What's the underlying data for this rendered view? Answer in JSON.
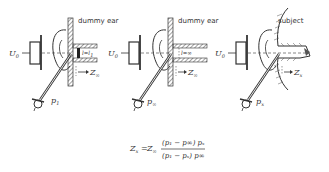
{
  "panels": [
    {
      "title": "dummy ear",
      "source_label": "U",
      "source_sub": "0",
      "pressure_label": "p",
      "pressure_sub": "1",
      "tube_label": "l=l",
      "tube_sub": "1",
      "impedance_label": "Z",
      "impedance_sub": "∞"
    },
    {
      "title": "dummy ear",
      "source_label": "U",
      "source_sub": "0",
      "pressure_label": "p",
      "pressure_sub": "∞",
      "tube_label": "l=∞",
      "tube_sub": "",
      "impedance_label": "Z",
      "impedance_sub": "∞"
    },
    {
      "title": "subject",
      "source_label": "U",
      "source_sub": "0",
      "pressure_label": "p",
      "pressure_sub": "x",
      "tube_label": "",
      "tube_sub": "",
      "impedance_label": "Z",
      "impedance_sub": "x"
    }
  ],
  "formula": {
    "lhs": "Z",
    "lhs_sub": "x",
    "eq": "=",
    "coef": "Z",
    "coef_sub": "∞",
    "numerator": "(p₁ − p∞) pₓ",
    "denominator": "(p₁ − pₓ) p∞"
  },
  "colors": {
    "ink": "#333333",
    "background": "#ffffff"
  }
}
